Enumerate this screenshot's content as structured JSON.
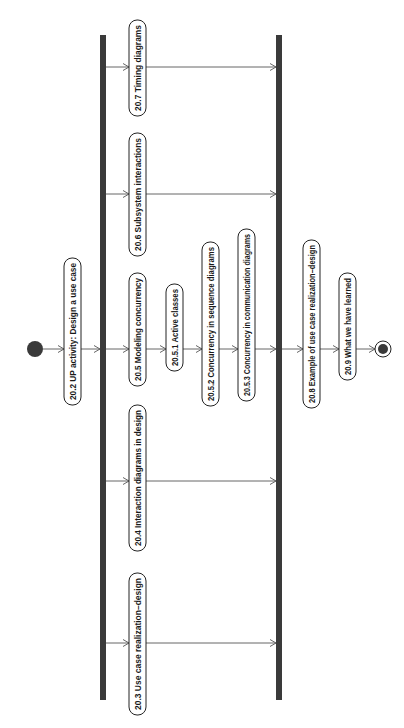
{
  "diagram": {
    "type": "UML activity diagram",
    "orientation": "rotated 90 degrees counter-clockwise",
    "colors": {
      "bar": "#3a3a3a",
      "node_border": "#222222",
      "flow": "#555555",
      "text": "#1a1a1a",
      "background": "#ffffff"
    },
    "start_node": {
      "name": "initial-node"
    },
    "end_node": {
      "name": "final-node"
    },
    "activities": [
      {
        "id": "a202",
        "label": "20.2 UP activity: Design a use case"
      },
      {
        "id": "a207",
        "label": "20.7 Timing diagrams"
      },
      {
        "id": "a206",
        "label": "20.6 Subsystem interactions"
      },
      {
        "id": "a205",
        "label": "20.5 Modeling concurrency"
      },
      {
        "id": "a204",
        "label": "20.4 Interaction diagrams in design"
      },
      {
        "id": "a203",
        "label": "20.3 Use case realization–design"
      },
      {
        "id": "a2051",
        "label": "20.5.1 Active classes"
      },
      {
        "id": "a2052",
        "label": "20.5.2 Concurrency in sequence diagrams"
      },
      {
        "id": "a2053",
        "label": "20.5.3 Concurrency in communication diagrams"
      },
      {
        "id": "a208",
        "label": "20.8 Example of use case realization–design"
      },
      {
        "id": "a209",
        "label": "20.9 What we have learned"
      }
    ],
    "bars": [
      {
        "id": "fork",
        "kind": "fork"
      },
      {
        "id": "join",
        "kind": "join"
      }
    ],
    "flows": [
      {
        "from": "start",
        "to": "a202"
      },
      {
        "from": "a202",
        "to": "fork"
      },
      {
        "from": "fork",
        "to": "a207"
      },
      {
        "from": "fork",
        "to": "a206"
      },
      {
        "from": "fork",
        "to": "a205"
      },
      {
        "from": "fork",
        "to": "a204"
      },
      {
        "from": "fork",
        "to": "a203"
      },
      {
        "from": "a205",
        "to": "a2051"
      },
      {
        "from": "a2051",
        "to": "a2052"
      },
      {
        "from": "a2052",
        "to": "a2053"
      },
      {
        "from": "a2053",
        "to": "join"
      },
      {
        "from": "a207",
        "to": "join"
      },
      {
        "from": "a206",
        "to": "join"
      },
      {
        "from": "a204",
        "to": "join"
      },
      {
        "from": "a203",
        "to": "join"
      },
      {
        "from": "join",
        "to": "a208"
      },
      {
        "from": "a208",
        "to": "a209"
      },
      {
        "from": "a209",
        "to": "end"
      }
    ]
  }
}
